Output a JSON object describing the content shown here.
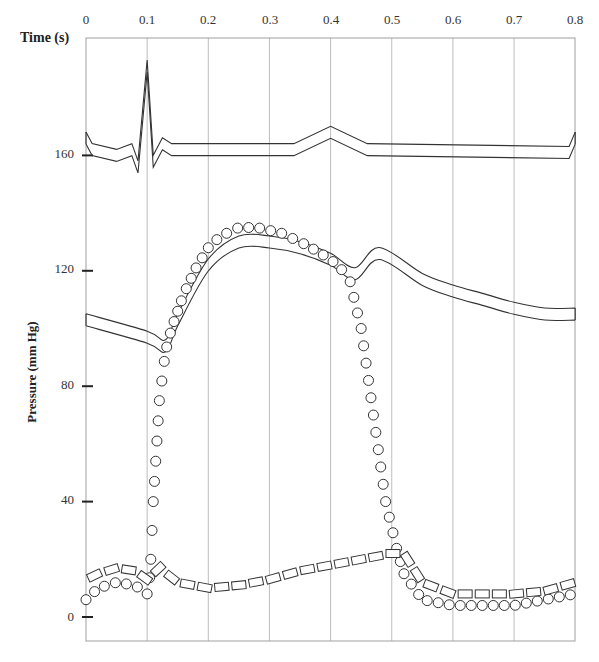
{
  "chart_data": {
    "type": "line",
    "title": "",
    "xlabel": "Time (s)",
    "ylabel": "Pressure (mm Hg)",
    "x_ticks": [
      "0",
      "0.1",
      "0.2",
      "0.3",
      "0.4",
      "0.5",
      "0.6",
      "0.7",
      "0.8"
    ],
    "y_ticks": [
      "0",
      "40",
      "80",
      "120",
      "160"
    ],
    "xlim": [
      0,
      0.8
    ],
    "ylim": [
      -8,
      200
    ],
    "grid": "vertical lines at each 0.1 s",
    "legend": null,
    "series": [
      {
        "name": "ECG trace (upper band, no pressure scale)",
        "style": "double outline band",
        "x": [
          0,
          0.01,
          0.05,
          0.075,
          0.085,
          0.1,
          0.11,
          0.125,
          0.14,
          0.34,
          0.4,
          0.46,
          0.79,
          0.8
        ],
        "y": [
          166,
          162,
          160,
          162,
          156,
          191,
          158,
          164,
          162,
          162,
          168,
          162,
          161,
          166
        ]
      },
      {
        "name": "Aortic pressure",
        "style": "double outline band",
        "x": [
          0,
          0.1,
          0.13,
          0.15,
          0.2,
          0.25,
          0.3,
          0.35,
          0.4,
          0.44,
          0.48,
          0.55,
          0.6,
          0.65,
          0.7,
          0.75,
          0.8
        ],
        "y": [
          103,
          97,
          94,
          103,
          122,
          130,
          130,
          128,
          124,
          119,
          126,
          117,
          113,
          110,
          107,
          105,
          105
        ]
      },
      {
        "name": "Left ventricular pressure",
        "style": "open circles",
        "x": [
          0,
          0.02,
          0.05,
          0.08,
          0.1,
          0.105,
          0.11,
          0.12,
          0.13,
          0.14,
          0.16,
          0.18,
          0.2,
          0.22,
          0.25,
          0.28,
          0.32,
          0.36,
          0.4,
          0.43,
          0.45,
          0.47,
          0.49,
          0.51,
          0.52,
          0.53,
          0.55,
          0.6,
          0.65,
          0.7,
          0.75,
          0.8
        ],
        "y": [
          6,
          10,
          12,
          11,
          8,
          15,
          40,
          75,
          92,
          100,
          112,
          121,
          128,
          132,
          135,
          135,
          133,
          129,
          124,
          118,
          100,
          70,
          40,
          22,
          15,
          12,
          6,
          4,
          4,
          4,
          6,
          8
        ]
      },
      {
        "name": "Left atrial pressure",
        "style": "open rectangles (dashed)",
        "x": [
          0,
          0.02,
          0.05,
          0.08,
          0.1,
          0.12,
          0.15,
          0.2,
          0.25,
          0.3,
          0.35,
          0.4,
          0.45,
          0.5,
          0.52,
          0.55,
          0.6,
          0.65,
          0.7,
          0.75,
          0.8
        ],
        "y": [
          13,
          15,
          17,
          16,
          13,
          17,
          12,
          10,
          11,
          13,
          16,
          18,
          20,
          22,
          22,
          12,
          8,
          8,
          8,
          9,
          12
        ]
      }
    ]
  },
  "axes": {
    "x_title": "Time (s)",
    "y_title": "Pressure (mm Hg)",
    "x_tick_labels": [
      "0",
      "0.1",
      "0.2",
      "0.3",
      "0.4",
      "0.5",
      "0.6",
      "0.7",
      "0.8"
    ],
    "y_tick_labels": [
      "160",
      "120",
      "80",
      "40",
      "0"
    ]
  },
  "colors": {
    "grid": "#bdbdbd",
    "frame": "#9a9a9a",
    "stroke": "#333333",
    "background": "#ffffff"
  }
}
